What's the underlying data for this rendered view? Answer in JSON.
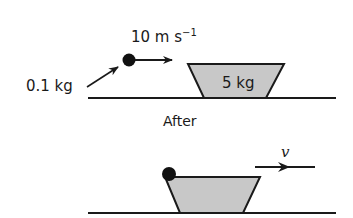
{
  "diagram": {
    "before": {
      "ball_mass_label": "0.1 kg",
      "ball_velocity_label": "10 m s",
      "ball_velocity_superscript": "−1",
      "block_mass_label": "5 kg"
    },
    "section_label": "After",
    "after": {
      "velocity_label": "v"
    },
    "colors": {
      "block_fill": "#c8c8c8",
      "stroke": "#1a1a1a",
      "ball": "#111111"
    }
  }
}
